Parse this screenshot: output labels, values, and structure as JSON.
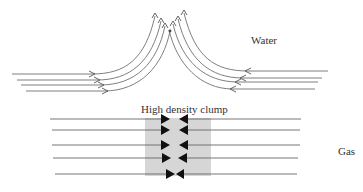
{
  "labels": {
    "water": "Water",
    "gas": "Gas",
    "clump": "High density clump"
  },
  "colors": {
    "line": "#666666",
    "arrow": "#111111",
    "clump_fill": "#d6d6d6"
  }
}
